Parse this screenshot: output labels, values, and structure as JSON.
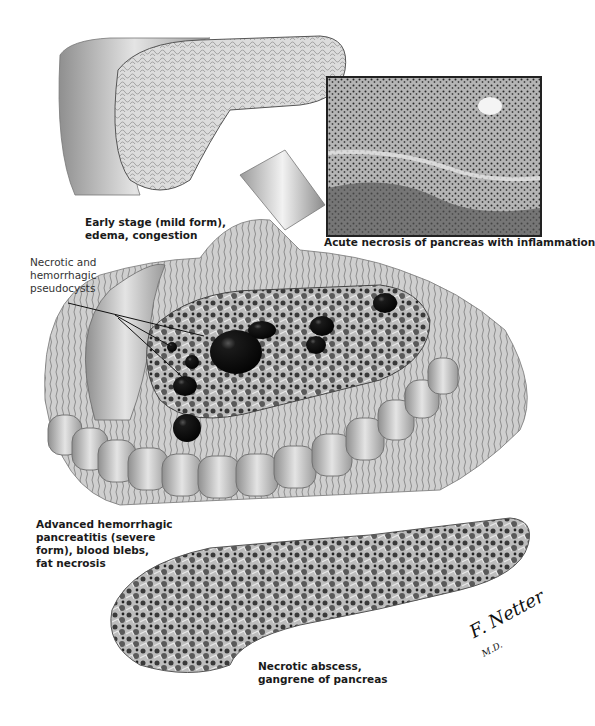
{
  "figure": {
    "type": "medical-illustration",
    "palette": {
      "background": "#ffffff",
      "tissue_light": "#d8d8d8",
      "tissue_mid": "#a8a8a8",
      "tissue_dark": "#3a3a3a",
      "cyst": "#111111",
      "text": "#1a1a1a"
    }
  },
  "labels": {
    "early_stage": "Early stage (mild form),\nedema, congestion",
    "pseudocysts": "Necrotic and\nhemorrhagic\npseudocysts",
    "advanced": "Advanced hemorrhagic\npancreatitis (severe\nform), blood blebs,\nfat necrosis",
    "necrotic_abscess": "Necrotic abscess,\ngangrene of pancreas"
  },
  "inset": {
    "caption": "Acute necrosis of pancreas with inflammation"
  },
  "signature": {
    "name": "F. Netter",
    "suffix": "M.D."
  }
}
